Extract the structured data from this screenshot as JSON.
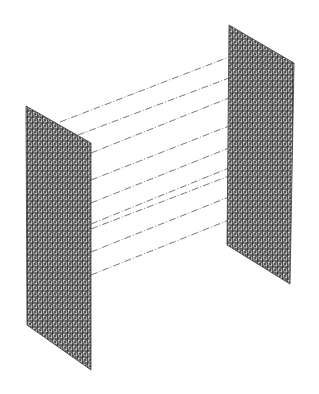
{
  "diagram": {
    "description": "Two parallel triangulated mesh panels connected by dashed lines in isometric view",
    "background": "#ffffff",
    "mesh_color": "#3a3a3a",
    "mesh_fill": "#9a9a9a",
    "connector_color": "#555555",
    "panels": [
      {
        "id": "left-panel",
        "corners": [
          [
            26,
            106
          ],
          [
            91,
            143
          ],
          [
            91,
            370
          ],
          [
            27,
            325
          ]
        ]
      },
      {
        "id": "right-panel",
        "corners": [
          [
            229,
            25
          ],
          [
            294,
            63
          ],
          [
            290,
            284
          ],
          [
            227,
            245
          ]
        ]
      }
    ],
    "connectors": [
      {
        "from": [
          60,
          122
        ],
        "to": [
          229,
          57
        ]
      },
      {
        "from": [
          78,
          135
        ],
        "to": [
          229,
          78
        ]
      },
      {
        "from": [
          91,
          153
        ],
        "to": [
          229,
          98
        ]
      },
      {
        "from": [
          91,
          180
        ],
        "to": [
          229,
          126
        ]
      },
      {
        "from": [
          91,
          203
        ],
        "to": [
          229,
          148
        ]
      },
      {
        "from": [
          91,
          224
        ],
        "to": [
          229,
          168
        ]
      },
      {
        "from": [
          91,
          229
        ],
        "to": [
          229,
          176
        ]
      },
      {
        "from": [
          91,
          252
        ],
        "to": [
          229,
          197
        ]
      },
      {
        "from": [
          91,
          275
        ],
        "to": [
          229,
          220
        ]
      }
    ]
  }
}
